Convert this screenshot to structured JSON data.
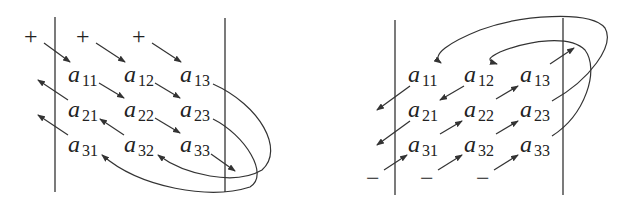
{
  "figure": {
    "element_letter": "a",
    "left_panel": {
      "name": "positive-products",
      "signs": [
        "+",
        "+",
        "+"
      ],
      "matrix": [
        [
          "11",
          "12",
          "13"
        ],
        [
          "21",
          "22",
          "23"
        ],
        [
          "31",
          "32",
          "33"
        ]
      ]
    },
    "right_panel": {
      "name": "negative-products",
      "signs": [
        "−",
        "−",
        "−"
      ],
      "matrix": [
        [
          "11",
          "12",
          "13"
        ],
        [
          "21",
          "22",
          "23"
        ],
        [
          "31",
          "32",
          "33"
        ]
      ]
    },
    "colors": {
      "ink": "#222222",
      "background": "#ffffff"
    }
  }
}
